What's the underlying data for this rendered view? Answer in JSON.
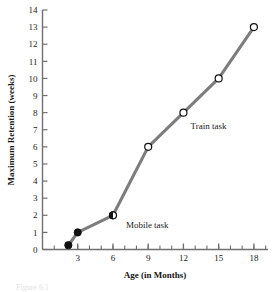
{
  "chart_data": {
    "type": "line",
    "title": "",
    "xlabel": "Age (in Months)",
    "ylabel": "Maximum Retention (weeks)",
    "xlim": [
      0,
      19.2
    ],
    "ylim": [
      0,
      14
    ],
    "grid": false,
    "legend_position": "inline-annotation",
    "x_ticks": [
      3,
      6,
      9,
      12,
      15,
      18
    ],
    "x_tick_labels": [
      "3",
      "6",
      "9",
      "12",
      "15",
      "18"
    ],
    "x_minor_ticks": [
      1,
      2,
      3,
      4,
      5,
      6,
      7,
      8,
      9,
      10,
      11,
      12,
      13,
      14,
      15,
      16,
      17,
      18,
      19
    ],
    "y_ticks": [
      0,
      1,
      2,
      3,
      4,
      5,
      6,
      7,
      8,
      9,
      10,
      11,
      12,
      13,
      14
    ],
    "y_tick_labels": [
      "0",
      "1",
      "2",
      "3",
      "4",
      "5",
      "6",
      "7",
      "8",
      "9",
      "10",
      "11",
      "12",
      "13",
      "14"
    ],
    "line_color": "#7d7d7d",
    "marker_edge_color": "#111111",
    "series": [
      {
        "name": "Mobile task",
        "marker": "filled-circle",
        "x": [
          2.2,
          3,
          6
        ],
        "values": [
          0.25,
          1,
          2
        ],
        "annotation": "Mobile task",
        "annotation_x": 7.1,
        "annotation_y": 1.28
      },
      {
        "name": "Train task",
        "marker": "open-circle",
        "x": [
          6,
          9,
          12,
          15,
          18
        ],
        "values": [
          2,
          6,
          8,
          10,
          13
        ],
        "annotation": "Train task",
        "annotation_x": 12.6,
        "annotation_y": 7.05
      }
    ]
  },
  "figure": {
    "caption_fragment": "Figure 6.1"
  }
}
